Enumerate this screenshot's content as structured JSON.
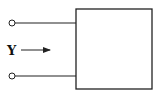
{
  "diagram": {
    "type": "one-port network",
    "input_label": "Y",
    "colors": {
      "stroke": "#222222",
      "background": "#ffffff"
    },
    "terminals": [
      {
        "name": "top-terminal",
        "cx": 12,
        "cy": 23
      },
      {
        "name": "bottom-terminal",
        "cx": 12,
        "cy": 76
      }
    ],
    "box": {
      "x": 76,
      "y": 9,
      "width": 76,
      "height": 80
    }
  }
}
